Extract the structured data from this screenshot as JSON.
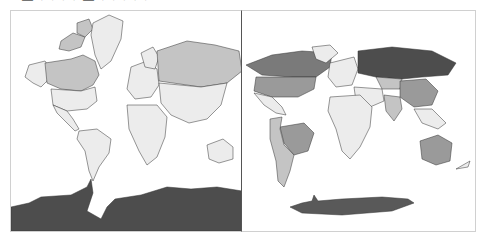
{
  "figure": {
    "caption_cropped": "— · · · · — · · · · ·",
    "panels": [
      {
        "id": "left",
        "projection": "Mercator",
        "description": "World map in Mercator projection, choropleth shading; Antarctica greatly enlarged at bottom"
      },
      {
        "id": "right",
        "projection": "Compromise (Robinson-like)",
        "description": "World map in a compromise projection with the same choropleth shading"
      }
    ]
  },
  "colors": {
    "ocean": "#ffffff",
    "class_light": "#ececec",
    "class_mid_light": "#c4c4c4",
    "class_mid": "#9a9a9a",
    "class_dark": "#595959",
    "border": "#333333"
  }
}
